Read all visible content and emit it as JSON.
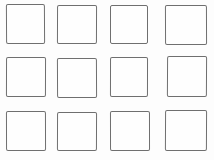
{
  "figure": {
    "type": "grid-of-empty-squares",
    "rows": 3,
    "columns": 4,
    "square_count": 12,
    "background_color": "#fdfdfd",
    "square_fill_color": "#fefefe",
    "stroke_color": "#6f6f6f"
  }
}
